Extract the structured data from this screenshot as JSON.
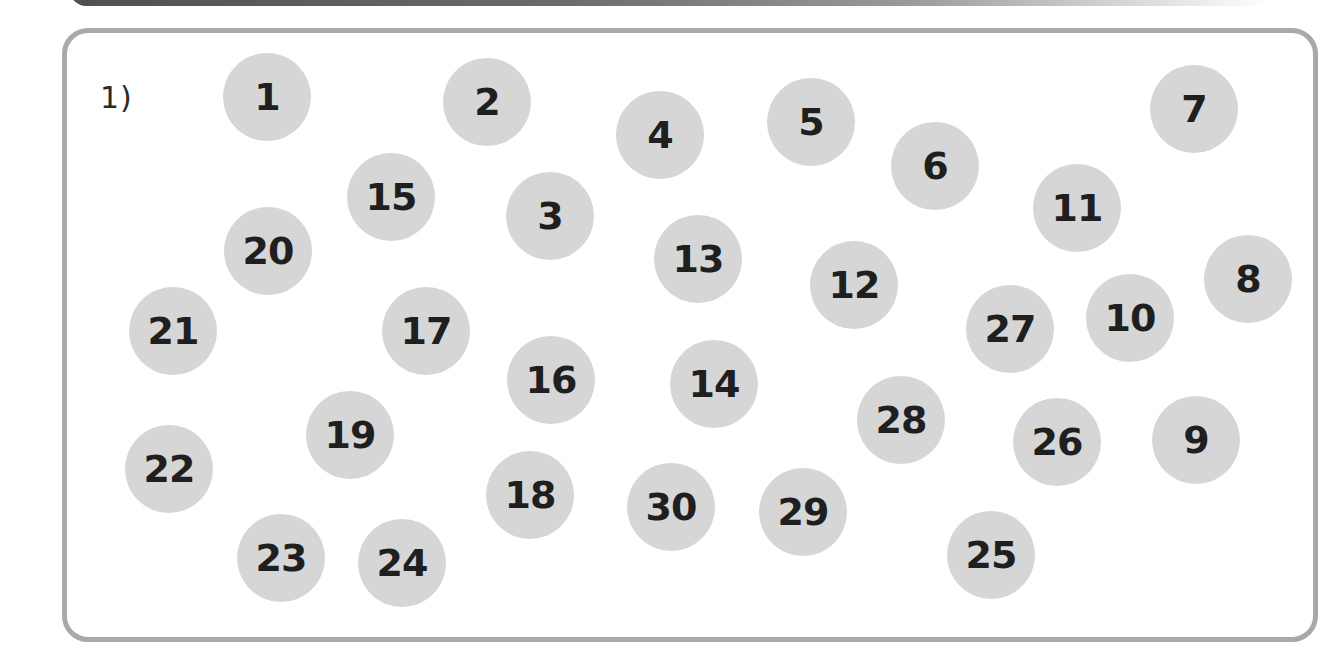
{
  "exercise": {
    "label": "1)",
    "dots": [
      {
        "n": "1",
        "x": 267,
        "y": 97
      },
      {
        "n": "2",
        "x": 487,
        "y": 102
      },
      {
        "n": "3",
        "x": 550,
        "y": 216
      },
      {
        "n": "4",
        "x": 660,
        "y": 135
      },
      {
        "n": "5",
        "x": 811,
        "y": 122
      },
      {
        "n": "6",
        "x": 935,
        "y": 166
      },
      {
        "n": "7",
        "x": 1194,
        "y": 109
      },
      {
        "n": "8",
        "x": 1248,
        "y": 279
      },
      {
        "n": "9",
        "x": 1196,
        "y": 440
      },
      {
        "n": "10",
        "x": 1130,
        "y": 318
      },
      {
        "n": "11",
        "x": 1077,
        "y": 208
      },
      {
        "n": "12",
        "x": 854,
        "y": 285
      },
      {
        "n": "13",
        "x": 698,
        "y": 259
      },
      {
        "n": "14",
        "x": 714,
        "y": 384
      },
      {
        "n": "15",
        "x": 391,
        "y": 197
      },
      {
        "n": "16",
        "x": 551,
        "y": 380
      },
      {
        "n": "17",
        "x": 426,
        "y": 331
      },
      {
        "n": "18",
        "x": 530,
        "y": 495
      },
      {
        "n": "19",
        "x": 350,
        "y": 435
      },
      {
        "n": "20",
        "x": 268,
        "y": 251
      },
      {
        "n": "21",
        "x": 173,
        "y": 331
      },
      {
        "n": "22",
        "x": 169,
        "y": 469
      },
      {
        "n": "23",
        "x": 281,
        "y": 558
      },
      {
        "n": "24",
        "x": 402,
        "y": 563
      },
      {
        "n": "25",
        "x": 991,
        "y": 555
      },
      {
        "n": "26",
        "x": 1057,
        "y": 442
      },
      {
        "n": "27",
        "x": 1010,
        "y": 329
      },
      {
        "n": "28",
        "x": 901,
        "y": 420
      },
      {
        "n": "29",
        "x": 803,
        "y": 512
      },
      {
        "n": "30",
        "x": 671,
        "y": 507
      }
    ]
  },
  "colors": {
    "dot_fill": "#d6d6d6",
    "dot_text": "#1f1f1f",
    "frame_border": "#a9a9a9"
  }
}
